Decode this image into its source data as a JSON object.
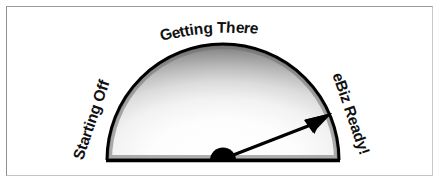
{
  "panel": {
    "background_color": "#ffffff",
    "frame_color": "#9a9a9a"
  },
  "gauge": {
    "title": "eBusiness Readiness Gauge",
    "labels": {
      "left": "Starting Off",
      "middle": "Getting There",
      "right": "eBiz Ready!"
    },
    "needle": {
      "value_angle_degrees": 21,
      "direction": "up-right",
      "points_to": "eBiz Ready!",
      "color": "#000000"
    },
    "colors": {
      "outline": "#000000",
      "gradient_center": "#ffffff",
      "gradient_edge": "#5a5a5a",
      "hub": "#000000",
      "text": "#111111"
    }
  },
  "chart_data": {
    "type": "gauge",
    "categories": [
      "Starting Off",
      "Getting There",
      "eBiz Ready!"
    ],
    "category_angles_degrees": [
      180,
      90,
      0
    ],
    "value_angle_degrees": 21,
    "value_fraction": 0.883,
    "range_degrees": [
      0,
      180
    ],
    "needle_tip": [
      332,
      114
    ],
    "center": [
      223,
      160
    ],
    "radius": 116,
    "xlabel": "",
    "ylabel": "",
    "grid": false,
    "legend": "none"
  }
}
